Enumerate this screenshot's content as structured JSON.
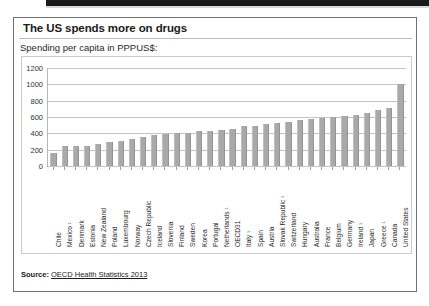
{
  "card": {
    "title": "The US spends more on drugs",
    "subtitle": "Spending per capita in PPPUS$:",
    "source_label": "Source:",
    "source_text": "OECD Health Statistics 2013"
  },
  "chart_data": {
    "type": "bar",
    "title": "The US spends more on drugs",
    "subtitle": "Spending per capita in PPPUS$:",
    "xlabel": "",
    "ylabel": "",
    "ylim": [
      0,
      1200
    ],
    "ytick_step": 200,
    "yticks": [
      "0",
      "200",
      "400",
      "600",
      "800",
      "1000",
      "1200"
    ],
    "grid": true,
    "legend": false,
    "bar_color": "#a6a6a6",
    "categories": [
      "Chile",
      "Mexico ¹",
      "Denmark",
      "Estonia",
      "New Zealand",
      "Poland",
      "Luxembourg",
      "Norway",
      "Czech Republic",
      "Iceland",
      "Slovenia",
      "Finland",
      "Sweden",
      "Korea",
      "Portugal",
      "Netherlands ¹",
      "OECD31",
      "Italy ¹",
      "Spain",
      "Austria",
      "Slovak Republic ¹",
      "Switzerland",
      "Hungary",
      "Australia",
      "France",
      "Belgium",
      "Germany",
      "Ireland ¹",
      "Japan",
      "Greece ¹",
      "Canada",
      "United States"
    ],
    "values": [
      160,
      245,
      245,
      250,
      275,
      300,
      310,
      330,
      360,
      375,
      390,
      400,
      405,
      425,
      430,
      440,
      455,
      490,
      495,
      510,
      530,
      545,
      560,
      570,
      590,
      600,
      615,
      625,
      645,
      690,
      705,
      1000
    ]
  }
}
